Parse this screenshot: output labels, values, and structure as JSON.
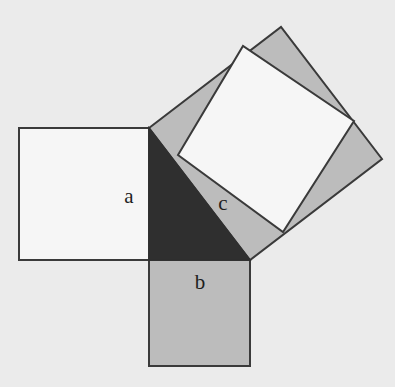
{
  "diagram": {
    "colors": {
      "background": "#ebebeb",
      "white_fill": "#f6f6f6",
      "gray_fill": "#bcbcbc",
      "dark_fill": "#2f2f2f",
      "stroke": "#3a3a3a"
    },
    "labels": {
      "a": "a",
      "b": "b",
      "c": "c"
    },
    "shapes": {
      "square_a": {
        "points": "19,128 149,128 149,260 19,260",
        "fill": "white"
      },
      "square_b": {
        "points": "149,260 250,260 250,366 149,366",
        "fill": "gray"
      },
      "right_triangle": {
        "points": "149,128 149,260 250,260",
        "fill": "dark"
      },
      "square_c_outer": {
        "points": "149,128 281,27 382,159 250,260",
        "fill": "gray"
      },
      "square_c_inner": {
        "points": "178,155 243,46 354,121 283,232",
        "fill": "white"
      }
    },
    "label_positions": {
      "a": [
        129,
        203
      ],
      "b": [
        200,
        289
      ],
      "c": [
        223,
        210
      ]
    }
  }
}
